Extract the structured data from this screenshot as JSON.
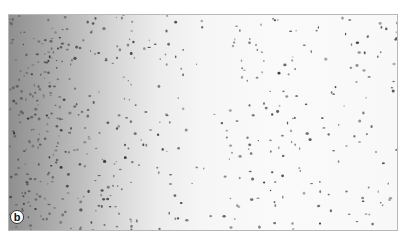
{
  "figure": {
    "panel_label": "b",
    "colors": {
      "dense_region": "#8f8f8f",
      "sparse_region": "#f8f8f8",
      "cell": "#555555",
      "border": "#b8b8b8"
    }
  }
}
